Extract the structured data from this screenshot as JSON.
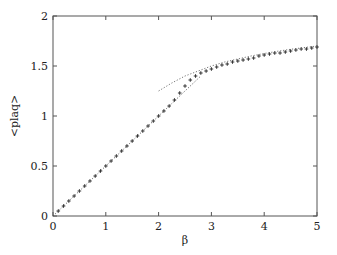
{
  "chart_data": {
    "type": "line",
    "title": "",
    "xlabel": "β",
    "ylabel": "<plaq>",
    "xlim": [
      0,
      5
    ],
    "ylim": [
      0,
      2
    ],
    "xticks": [
      0,
      1,
      2,
      3,
      4,
      5
    ],
    "xtick_labels": [
      "0",
      "1",
      "2",
      "3",
      "4",
      "5"
    ],
    "yticks": [
      0,
      0.5,
      1,
      1.5,
      2
    ],
    "ytick_labels": [
      "0",
      "0.5",
      "1",
      "1.5",
      "2"
    ],
    "grid": false,
    "legend": "none",
    "series": [
      {
        "name": "data",
        "style": "plus-markers",
        "color": "#333333",
        "x": [
          0.1,
          0.2,
          0.3,
          0.4,
          0.5,
          0.6,
          0.7,
          0.8,
          0.9,
          1.0,
          1.1,
          1.2,
          1.3,
          1.4,
          1.5,
          1.6,
          1.7,
          1.8,
          1.9,
          2.0,
          2.1,
          2.2,
          2.3,
          2.4,
          2.5,
          2.6,
          2.7,
          2.8,
          2.9,
          3.0,
          3.1,
          3.2,
          3.3,
          3.4,
          3.5,
          3.6,
          3.7,
          3.8,
          3.9,
          4.0,
          4.1,
          4.2,
          4.3,
          4.4,
          4.5,
          4.6,
          4.7,
          4.8,
          4.9,
          5.0
        ],
        "y": [
          0.05,
          0.1,
          0.15,
          0.2,
          0.25,
          0.3,
          0.35,
          0.4,
          0.45,
          0.5,
          0.55,
          0.6,
          0.65,
          0.7,
          0.75,
          0.8,
          0.85,
          0.9,
          0.95,
          1.0,
          1.05,
          1.1,
          1.16,
          1.23,
          1.3,
          1.36,
          1.4,
          1.43,
          1.45,
          1.47,
          1.49,
          1.51,
          1.52,
          1.54,
          1.55,
          1.56,
          1.57,
          1.58,
          1.6,
          1.61,
          1.62,
          1.63,
          1.63,
          1.64,
          1.65,
          1.66,
          1.67,
          1.67,
          1.68,
          1.69
        ]
      },
      {
        "name": "strong-coupling",
        "style": "dotted",
        "color": "#555555",
        "x": [
          0,
          0.5,
          1,
          1.5,
          2,
          2.5,
          2.8
        ],
        "y": [
          0,
          0.25,
          0.5,
          0.75,
          1.0,
          1.25,
          1.4
        ]
      },
      {
        "name": "weak-coupling",
        "style": "dotted",
        "color": "#666666",
        "x": [
          2.0,
          2.25,
          2.5,
          2.75,
          3.0,
          3.25,
          3.5,
          3.75,
          4.0,
          4.25,
          4.5,
          4.75,
          5.0
        ],
        "y": [
          1.25,
          1.33,
          1.4,
          1.45,
          1.5,
          1.54,
          1.57,
          1.6,
          1.625,
          1.647,
          1.667,
          1.684,
          1.7
        ]
      }
    ]
  }
}
